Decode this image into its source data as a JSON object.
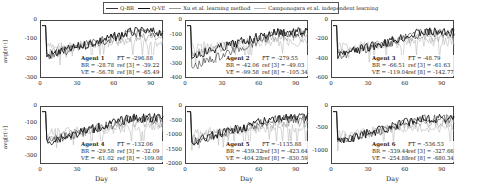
{
  "legend": [
    {
      "label": "Q-BR",
      "color": "#333333",
      "width": 1.2
    },
    {
      "label": "Q-VE",
      "color": "#111111",
      "width": 1.6
    },
    {
      "label": "Xu et al. learning method",
      "color": "#999999",
      "width": 0.8
    },
    {
      "label": "Camponogara et al. independent learning",
      "color": "#bbbbbb",
      "width": 0.8
    }
  ],
  "axes": {
    "ylabel": "avg[r(·)]",
    "xlabel": "Day"
  },
  "chart_data": [
    {
      "type": "line",
      "title": "Agent 1",
      "xlabel": "",
      "ylabel": "avg[r(·)]",
      "xlim": [
        0,
        100
      ],
      "ylim": [
        -300,
        0
      ],
      "xticks": [
        "0",
        "30",
        "60",
        "90"
      ],
      "yticks": [
        "0",
        "-100",
        "-200",
        "-300"
      ],
      "annotation": {
        "agent": "Agent 1",
        "br": "BR = -28.78",
        "ve": "VE = -56.78",
        "ft": "FT = -296.88",
        "ref3": "ref [3] = -39.22",
        "ref8": "ref [8] = -65.49"
      }
    },
    {
      "type": "line",
      "title": "Agent 2",
      "xlabel": "",
      "ylabel": "",
      "xlim": [
        0,
        100
      ],
      "ylim": [
        -400,
        0
      ],
      "xticks": [
        "0",
        "30",
        "60",
        "90"
      ],
      "yticks": [
        "0",
        "-100",
        "-200",
        "-300",
        "-400"
      ],
      "annotation": {
        "agent": "Agent 2",
        "br": "BR = -42.06",
        "ve": "VE = -99.58",
        "ft": "FT = -279.55",
        "ref3": "ref [3] = -49.03",
        "ref8": "ref [8] = -105.34"
      }
    },
    {
      "type": "line",
      "title": "Agent 3",
      "xlabel": "",
      "ylabel": "",
      "xlim": [
        0,
        100
      ],
      "ylim": [
        -600,
        0
      ],
      "xticks": [
        "0",
        "30",
        "60",
        "90"
      ],
      "yticks": [
        "0",
        "-200",
        "-400",
        "-600"
      ],
      "annotation": {
        "agent": "Agent 3",
        "br": "BR = -66.51",
        "ve": "VE = -119.04",
        "ft": "FT = -48.79",
        "ref3": "ref [3] = -61.63",
        "ref8": "ref [8] = -142.77"
      }
    },
    {
      "type": "line",
      "title": "Agent 4",
      "xlabel": "Day",
      "ylabel": "avg[r(·)]",
      "xlim": [
        0,
        100
      ],
      "ylim": [
        -350,
        0
      ],
      "xticks": [
        "0",
        "30",
        "60",
        "90"
      ],
      "yticks": [
        "0",
        "-100",
        "-200",
        "-300"
      ],
      "annotation": {
        "agent": "Agent 4",
        "br": "BR = -29.58",
        "ve": "VE = -61.02",
        "ft": "FT = -132.06",
        "ref3": "ref [3] = -32.09",
        "ref8": "ref [8] = -109.08"
      }
    },
    {
      "type": "line",
      "title": "Agent 5",
      "xlabel": "Day",
      "ylabel": "",
      "xlim": [
        0,
        100
      ],
      "ylim": [
        -2000,
        0
      ],
      "xticks": [
        "0",
        "30",
        "60",
        "90"
      ],
      "yticks": [
        "0",
        "-500",
        "-1000",
        "-1500",
        "-2000"
      ],
      "annotation": {
        "agent": "Agent 5",
        "br": "BR = -439.32",
        "ve": "VE = -404.28",
        "ft": "FT = -1135.88",
        "ref3": "ref [3] = -423.64",
        "ref8": "ref [8] = -830.59"
      }
    },
    {
      "type": "line",
      "title": "Agent 6",
      "xlabel": "Day",
      "ylabel": "",
      "xlim": [
        0,
        100
      ],
      "ylim": [
        -1300,
        0
      ],
      "xticks": [
        "0",
        "30",
        "60",
        "90"
      ],
      "yticks": [
        "0",
        "-500",
        "-1000"
      ],
      "annotation": {
        "agent": "Agent 6",
        "br": "BR = -339.44",
        "ve": "VE = -254.88",
        "ft": "FT = -536.53",
        "ref3": "ref [3] = -327.66",
        "ref8": "ref [8] = -680.34"
      }
    }
  ]
}
